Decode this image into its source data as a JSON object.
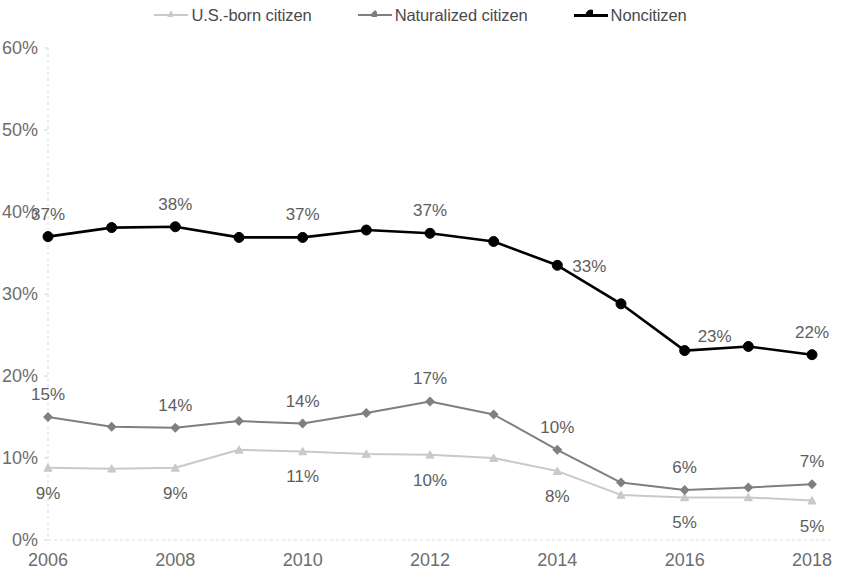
{
  "legend": {
    "position": "top-center",
    "items": [
      {
        "label": "U.S.-born citizen",
        "color": "#c9c9c9",
        "marker": "triangle"
      },
      {
        "label": "Naturalized citizen",
        "color": "#7f7f7f",
        "marker": "diamond"
      },
      {
        "label": "Noncitizen",
        "color": "#000000",
        "marker": "circle"
      }
    ]
  },
  "axes": {
    "y_ticks": [
      "0%",
      "10%",
      "20%",
      "30%",
      "40%",
      "50%",
      "60%"
    ],
    "x_ticks": [
      "2006",
      "2008",
      "2010",
      "2012",
      "2014",
      "2016",
      "2018"
    ]
  },
  "chart_data": {
    "type": "line",
    "title": "",
    "subtitle": "",
    "xlabel": "",
    "ylabel": "",
    "grid": false,
    "legend_position": "top-center",
    "xlim": [
      2006,
      2018
    ],
    "ylim": [
      0,
      60
    ],
    "y_tick_values": [
      0,
      10,
      20,
      30,
      40,
      50,
      60
    ],
    "x_tick_values": [
      2006,
      2008,
      2010,
      2012,
      2014,
      2016,
      2018
    ],
    "x": [
      2006,
      2007,
      2008,
      2009,
      2010,
      2011,
      2012,
      2013,
      2014,
      2015,
      2016,
      2017,
      2018
    ],
    "series": [
      {
        "name": "U.S.-born citizen",
        "color": "#c9c9c9",
        "marker": "triangle",
        "values": [
          8.8,
          8.7,
          8.8,
          11.0,
          10.8,
          10.5,
          10.4,
          10.0,
          8.4,
          5.5,
          5.2,
          5.2,
          4.8
        ],
        "labels": [
          {
            "x": 2006,
            "value": 9,
            "text": "9%",
            "position": "below"
          },
          {
            "x": 2008,
            "value": 9,
            "text": "9%",
            "position": "below"
          },
          {
            "x": 2010,
            "value": 11,
            "text": "11%",
            "position": "below"
          },
          {
            "x": 2012,
            "value": 10,
            "text": "10%",
            "position": "below"
          },
          {
            "x": 2014,
            "value": 8,
            "text": "8%",
            "position": "below"
          },
          {
            "x": 2016,
            "value": 5,
            "text": "5%",
            "position": "below"
          },
          {
            "x": 2018,
            "value": 5,
            "text": "5%",
            "position": "below"
          }
        ]
      },
      {
        "name": "Naturalized citizen",
        "color": "#7f7f7f",
        "marker": "diamond",
        "values": [
          15.0,
          13.8,
          13.7,
          14.5,
          14.2,
          15.5,
          16.9,
          15.3,
          11.0,
          7.0,
          6.1,
          6.4,
          6.8
        ],
        "labels": [
          {
            "x": 2006,
            "value": 15,
            "text": "15%",
            "position": "above"
          },
          {
            "x": 2008,
            "value": 14,
            "text": "14%",
            "position": "above"
          },
          {
            "x": 2010,
            "value": 14,
            "text": "14%",
            "position": "above"
          },
          {
            "x": 2012,
            "value": 17,
            "text": "17%",
            "position": "above"
          },
          {
            "x": 2014,
            "value": 10,
            "text": "10%",
            "position": "above"
          },
          {
            "x": 2016,
            "value": 6,
            "text": "6%",
            "position": "above"
          },
          {
            "x": 2018,
            "value": 7,
            "text": "7%",
            "position": "above"
          }
        ]
      },
      {
        "name": "Noncitizen",
        "color": "#000000",
        "marker": "circle",
        "values": [
          37.0,
          38.1,
          38.2,
          36.9,
          36.9,
          37.8,
          37.4,
          36.4,
          33.5,
          28.8,
          23.1,
          23.6,
          22.6
        ],
        "labels": [
          {
            "x": 2006,
            "value": 37,
            "text": "37%",
            "position": "above"
          },
          {
            "x": 2008,
            "value": 38,
            "text": "38%",
            "position": "above"
          },
          {
            "x": 2010,
            "value": 37,
            "text": "37%",
            "position": "above"
          },
          {
            "x": 2012,
            "value": 37,
            "text": "37%",
            "position": "above"
          },
          {
            "x": 2014,
            "value": 33,
            "text": "33%",
            "position": "right"
          },
          {
            "x": 2016,
            "value": 23,
            "text": "23%",
            "position": "above-right"
          },
          {
            "x": 2018,
            "value": 22,
            "text": "22%",
            "position": "above"
          }
        ]
      }
    ]
  }
}
